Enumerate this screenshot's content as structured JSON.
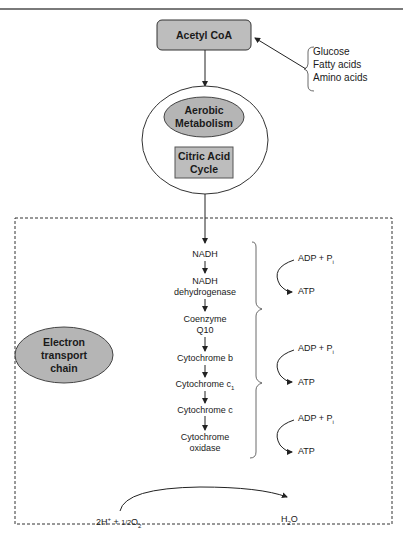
{
  "diagram": {
    "acetyl_coa": "Acetyl CoA",
    "sources": [
      "Glucose",
      "Fatty acids",
      "Amino acids"
    ],
    "aerobic": [
      "Aerobic",
      "Metabolism"
    ],
    "citric": [
      "Citric Acid",
      "Cycle"
    ],
    "etc_label": [
      "Electron",
      "transport",
      "chain"
    ],
    "chain": [
      {
        "lines": [
          "NADH"
        ]
      },
      {
        "lines": [
          "NADH",
          "dehydrogenase"
        ]
      },
      {
        "lines": [
          "Coenzyme",
          "Q10"
        ]
      },
      {
        "lines": [
          "Cytochrome b"
        ]
      },
      {
        "lines": [
          "Cytochrome c",
          "1"
        ]
      },
      {
        "lines": [
          "Cytochrome c"
        ]
      },
      {
        "lines": [
          "Cytochrome",
          "oxidase"
        ]
      }
    ],
    "phosphorylation": [
      {
        "input": "ADP + P",
        "input_sub": "i",
        "output": "ATP"
      },
      {
        "input": "ADP + P",
        "input_sub": "i",
        "output": "ATP"
      },
      {
        "input": "ADP + P",
        "input_sub": "i",
        "output": "ATP"
      }
    ],
    "reaction": {
      "reactant": "2H+ + 1/2O2",
      "reactant_parts": {
        "a": "2H",
        "a_sup": "+",
        "b": " + ",
        "half": "1/2",
        "c": "O",
        "c_sub": "2"
      },
      "product_parts": {
        "a": "H",
        "a_sub": "2",
        "b": "O"
      }
    },
    "colors": {
      "box_fill": "#bdbdbd",
      "ellipse_fill": "#b5b5b5",
      "line": "#222222",
      "top_rule": "#7a7a7a"
    }
  }
}
